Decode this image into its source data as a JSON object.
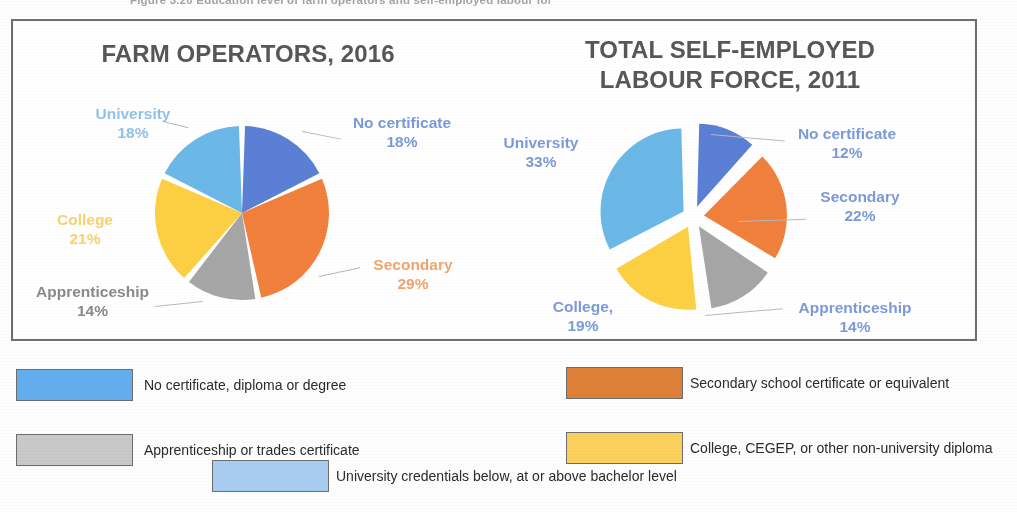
{
  "figure": {
    "caption": "Figure 3.20  Education level of farm operators and self-employed labour force"
  },
  "colors": {
    "no_certificate": "#5b7fd4",
    "secondary": "#f0803c",
    "apprenticeship": "#a6a6a6",
    "college": "#fdd043",
    "university": "#6bb8e8",
    "legend_secondary_swatch": "#dd8038",
    "legend_college_swatch": "#fbd05c",
    "legend_university_swatch": "#a9cdf0",
    "legend_no_certificate_swatch": "#64aeee",
    "legend_apprenticeship_swatch": "#c9c9c9",
    "label_blue": "#7d9ad8",
    "label_lightblue": "#8fc3e8",
    "label_orange": "#f2a46c",
    "label_yellow": "#f7d270",
    "label_gray": "#8a8a8a",
    "title_gray": "#575757",
    "frame_border": "#6f6f6f"
  },
  "chart_data": [
    {
      "type": "pie",
      "title": "FARM OPERATORS, 2016",
      "title_lines": [
        "FARM OPERATORS, 2016"
      ],
      "exploded": false,
      "start_angle_deg": 0,
      "categories": [
        "No certificate",
        "Secondary",
        "Apprenticeship",
        "College",
        "University"
      ],
      "values": [
        18,
        29,
        14,
        21,
        18
      ],
      "value_labels": [
        "18%",
        "29%",
        "14%",
        "21%",
        "18%"
      ],
      "units": "percent",
      "slices": [
        {
          "name": "No certificate",
          "label": "No certificate",
          "pct_text": "18%",
          "value": 18,
          "color": "#5b7fd4",
          "label_color": "#7d9ad8"
        },
        {
          "name": "Secondary",
          "label": "Secondary",
          "pct_text": "29%",
          "value": 29,
          "color": "#f0803c",
          "label_color": "#f2a46c"
        },
        {
          "name": "Apprenticeship",
          "label": "Apprenticeship",
          "pct_text": "14%",
          "value": 14,
          "color": "#a6a6a6",
          "label_color": "#8a8a8a"
        },
        {
          "name": "College",
          "label": "College",
          "pct_text": "21%",
          "value": 21,
          "color": "#fdd043",
          "label_color": "#f7d270"
        },
        {
          "name": "University",
          "label": "University",
          "pct_text": "18%",
          "value": 18,
          "color": "#6bb8e8",
          "label_color": "#8fc3e8"
        }
      ]
    },
    {
      "type": "pie",
      "title": "TOTAL SELF-EMPLOYED LABOUR FORCE, 2011",
      "title_lines": [
        "TOTAL SELF-EMPLOYED",
        "LABOUR FORCE, 2011"
      ],
      "exploded": true,
      "start_angle_deg": 0,
      "categories": [
        "No certificate",
        "Secondary",
        "Apprenticeship",
        "College,",
        "University"
      ],
      "values": [
        12,
        22,
        14,
        19,
        33
      ],
      "value_labels": [
        "12%",
        "22%",
        "14%",
        "19%",
        "33%"
      ],
      "units": "percent",
      "slices": [
        {
          "name": "No certificate",
          "label": "No certificate",
          "pct_text": "12%",
          "value": 12,
          "color": "#5b7fd4",
          "label_color": "#7d9ad8"
        },
        {
          "name": "Secondary",
          "label": "Secondary",
          "pct_text": "22%",
          "value": 22,
          "color": "#f0803c",
          "label_color": "#7d9ad8"
        },
        {
          "name": "Apprenticeship",
          "label": "Apprenticeship",
          "pct_text": "14%",
          "value": 14,
          "color": "#a6a6a6",
          "label_color": "#7d9ad8"
        },
        {
          "name": "College,",
          "label": "College,",
          "pct_text": "19%",
          "value": 19,
          "color": "#fdd043",
          "label_color": "#7d9ad8"
        },
        {
          "name": "University",
          "label": "University",
          "pct_text": "33%",
          "value": 33,
          "color": "#6bb8e8",
          "label_color": "#7d9ad8"
        }
      ]
    }
  ],
  "legend": {
    "items": [
      {
        "key": "no_certificate",
        "label": "No certificate, diploma or degree",
        "color": "#64aeee"
      },
      {
        "key": "secondary",
        "label": "Secondary school certificate or equivalent",
        "color": "#dd8038"
      },
      {
        "key": "apprenticeship",
        "label": "Apprenticeship or trades certificate",
        "color": "#c9c9c9"
      },
      {
        "key": "college",
        "label": "College, CEGEP, or other non-university diploma",
        "color": "#fbd05c"
      },
      {
        "key": "university",
        "label": "University credentials below, at or above bachelor level",
        "color": "#a9cdf0"
      }
    ]
  }
}
